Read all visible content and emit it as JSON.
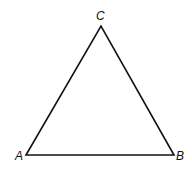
{
  "diagram": {
    "type": "triangle",
    "vertices": [
      {
        "label": "A",
        "x": 26,
        "y": 155
      },
      {
        "label": "B",
        "x": 174,
        "y": 155
      },
      {
        "label": "C",
        "x": 101,
        "y": 26
      }
    ],
    "stroke_color": "#111111"
  }
}
